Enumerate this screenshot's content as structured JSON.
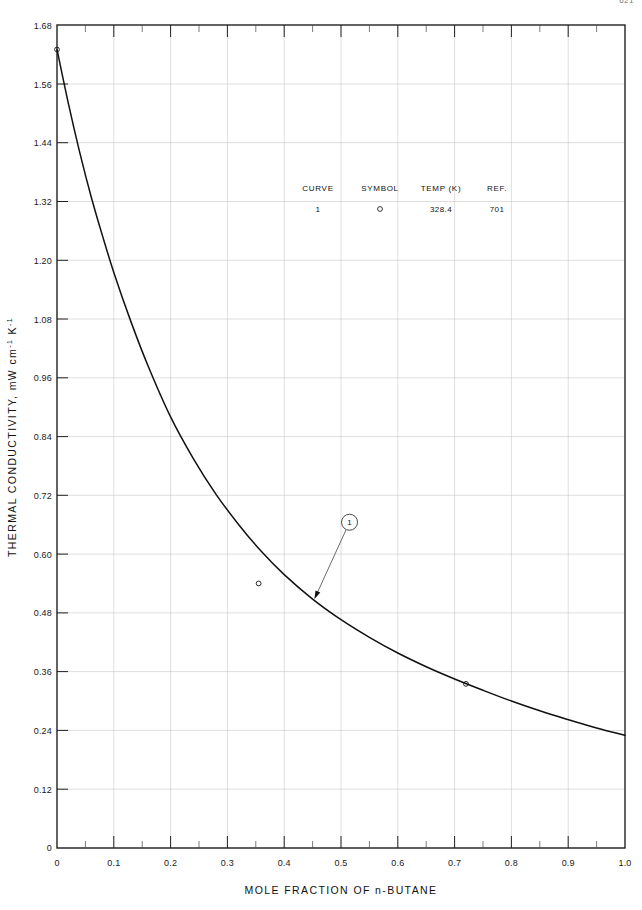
{
  "page": {
    "number": "621"
  },
  "chart_data": {
    "type": "line",
    "title": "",
    "xlabel": "MOLE FRACTION OF n-BUTANE",
    "ylabel": "THERMAL CONDUCTIVITY, mW cm",
    "ylabel_sup1": "-1",
    "ylabel_mid": " K",
    "ylabel_sup2": "-1",
    "ylabel_full": "THERMAL CONDUCTIVITY, mW cm-1 K-1",
    "xlim": [
      0,
      1.0
    ],
    "ylim": [
      0,
      1.68
    ],
    "grid": true,
    "x_ticks": [
      0,
      0.1,
      0.2,
      0.3,
      0.4,
      0.5,
      0.6,
      0.7,
      0.8,
      0.9,
      1.0
    ],
    "x_tick_labels": [
      "0",
      "0.1",
      "0.2",
      "0.3",
      "0.4",
      "0.5",
      "0.6",
      "0.7",
      "0.8",
      "0.9",
      "1.0"
    ],
    "x_minor_step": 0.05,
    "y_ticks": [
      0,
      0.12,
      0.24,
      0.36,
      0.48,
      0.6,
      0.72,
      0.84,
      0.96,
      1.08,
      1.2,
      1.32,
      1.44,
      1.56,
      1.68
    ],
    "y_tick_labels": [
      "0",
      "0.12",
      "0.24",
      "0.36",
      "0.48",
      "0.60",
      "0.72",
      "0.84",
      "0.96",
      "1.08",
      "1.20",
      "1.32",
      "1.44",
      "1.56",
      "1.68"
    ],
    "series": [
      {
        "name": "1",
        "curve_label": "1",
        "symbol": "circle",
        "curve_x": [
          0.0,
          0.02,
          0.04,
          0.06,
          0.08,
          0.1,
          0.13,
          0.16,
          0.2,
          0.24,
          0.28,
          0.32,
          0.36,
          0.4,
          0.45,
          0.5,
          0.55,
          0.6,
          0.65,
          0.7,
          0.75,
          0.8,
          0.85,
          0.9,
          0.95,
          1.0
        ],
        "curve_y": [
          1.63,
          1.52,
          1.42,
          1.33,
          1.25,
          1.175,
          1.075,
          0.985,
          0.88,
          0.795,
          0.722,
          0.66,
          0.605,
          0.558,
          0.508,
          0.466,
          0.43,
          0.398,
          0.37,
          0.345,
          0.322,
          0.3,
          0.28,
          0.262,
          0.245,
          0.23
        ],
        "points_x": [
          0.0,
          0.355,
          0.72
        ],
        "points_y": [
          1.63,
          0.54,
          0.335
        ]
      }
    ],
    "annotation": {
      "label": "1",
      "tag_x": 0.515,
      "tag_y": 0.665,
      "arrow_to_x": 0.452,
      "arrow_to_y": 0.505
    },
    "legend": {
      "headers": [
        "CURVE",
        "SYMBOL",
        "TEMP (K)",
        "REF."
      ],
      "rows": [
        {
          "curve": "1",
          "symbol": "○",
          "temp": "328.4",
          "ref": "701"
        }
      ]
    }
  }
}
